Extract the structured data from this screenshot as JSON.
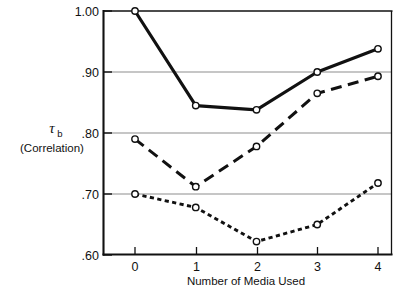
{
  "chart_data": {
    "type": "line",
    "title": "",
    "subtitle": "",
    "xlabel": "Number of Media  Used",
    "ylabel": "τ",
    "ylabel_subscript": "b",
    "ylabel_secondary": "(Correlation)",
    "x": [
      0,
      1,
      2,
      3,
      4
    ],
    "categories": [
      "0",
      "1",
      "2",
      "3",
      "4"
    ],
    "xtick_labels": [
      "0",
      "1",
      "2",
      "3",
      "4"
    ],
    "ytick_labels": [
      "1.00",
      ".90",
      ".80",
      ".70",
      ".60"
    ],
    "ytick_values": [
      1.0,
      0.9,
      0.8,
      0.7,
      0.6
    ],
    "xlim": [
      -0.52,
      4.23
    ],
    "ylim": [
      0.6,
      1.0
    ],
    "grid": "horizontal-gridlines-at-.90-.80-.70",
    "legend_position": "none",
    "marker": "open-circle",
    "series": [
      {
        "name": "solid-line-series",
        "linestyle": "solid",
        "linewidth": 3.2,
        "color": "#111111",
        "values": [
          1.0,
          0.845,
          0.838,
          0.9,
          0.938
        ]
      },
      {
        "name": "dashed-line-series",
        "linestyle": "dashed",
        "linewidth": 3.0,
        "color": "#111111",
        "values": [
          0.79,
          0.712,
          0.778,
          0.865,
          0.893
        ]
      },
      {
        "name": "dotted-line-series",
        "linestyle": "dotted",
        "linewidth": 2.8,
        "color": "#111111",
        "values": [
          0.7,
          0.678,
          0.622,
          0.65,
          0.718
        ]
      }
    ]
  },
  "colors": {
    "ink": "#111111",
    "gridline": "#8d8d8d",
    "background": "#ffffff"
  }
}
